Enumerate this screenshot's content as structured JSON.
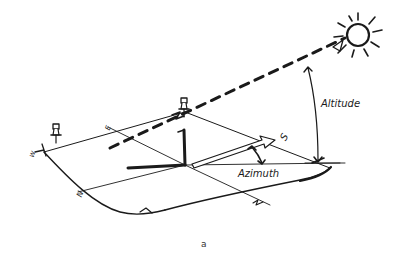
{
  "diagram": {
    "type": "sun-position-sketch",
    "labels": {
      "altitude": "Altitude",
      "azimuth": "Azimuth",
      "south": "S",
      "east": "E",
      "north": "N",
      "west": "W"
    },
    "caption": "a",
    "colors": {
      "ink": "#1a1a1a",
      "background": "#ffffff"
    },
    "icons": [
      "sun-icon",
      "thumbtack-icon",
      "thumbtack-icon",
      "gnomon",
      "south-arrow"
    ]
  }
}
